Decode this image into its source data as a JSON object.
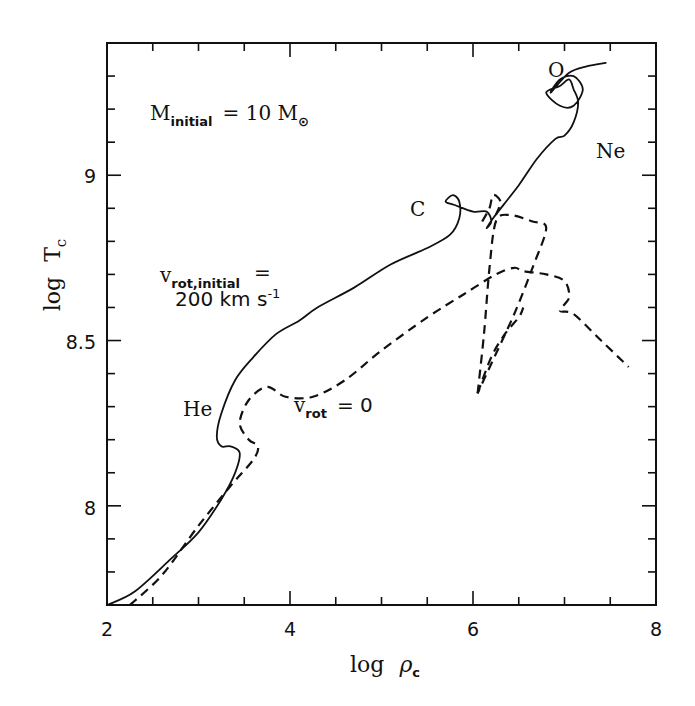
{
  "chart_data": {
    "type": "line",
    "title": "",
    "xlabel": "log ρc",
    "ylabel": "log Tc",
    "xlim": [
      2,
      8
    ],
    "ylim": [
      7.7,
      9.4
    ],
    "x_major_ticks": [
      2,
      4,
      6,
      8
    ],
    "x_tick_labels": [
      "2",
      "4",
      "6",
      "8"
    ],
    "x_minor_step": 0.5,
    "y_major_ticks": [
      8,
      8.5,
      9
    ],
    "y_tick_labels": [
      "8",
      "8.5",
      "9"
    ],
    "y_minor_step": 0.1,
    "grid": false,
    "legend": "none (inline annotations)",
    "series": [
      {
        "name": "v_rot,initial = 200 km s^-1",
        "style": "solid",
        "x": [
          2.0,
          2.3,
          2.7,
          3.0,
          3.25,
          3.4,
          3.45,
          3.35,
          3.25,
          3.2,
          3.25,
          3.4,
          3.6,
          3.85,
          4.1,
          4.3,
          4.7,
          5.1,
          5.5,
          5.75,
          5.85,
          5.85,
          5.78,
          5.7,
          5.8,
          6.0,
          6.15,
          6.2,
          6.15,
          6.22,
          6.5,
          6.7,
          6.9,
          7.0,
          7.1,
          7.15,
          7.1,
          7.05,
          6.95,
          6.8,
          6.95,
          7.1,
          7.2,
          7.1,
          6.95,
          6.85,
          7.05,
          7.25,
          7.45
        ],
        "y": [
          7.7,
          7.74,
          7.84,
          7.92,
          8.02,
          8.1,
          8.16,
          8.18,
          8.18,
          8.21,
          8.28,
          8.38,
          8.45,
          8.52,
          8.56,
          8.6,
          8.66,
          8.73,
          8.78,
          8.82,
          8.87,
          8.92,
          8.94,
          8.92,
          8.91,
          8.89,
          8.89,
          8.86,
          8.84,
          8.87,
          8.97,
          9.05,
          9.11,
          9.12,
          9.16,
          9.22,
          9.26,
          9.29,
          9.27,
          9.25,
          9.21,
          9.21,
          9.26,
          9.3,
          9.29,
          9.25,
          9.31,
          9.33,
          9.34
        ],
        "labels": [
          {
            "text": "He",
            "x": 3.08,
            "y": 8.27
          },
          {
            "text": "C",
            "x": 5.45,
            "y": 8.9
          },
          {
            "text": "Ne",
            "x": 7.3,
            "y": 9.06
          },
          {
            "text": "O",
            "x": 6.85,
            "y": 9.33
          }
        ]
      },
      {
        "name": "v_rot = 0",
        "style": "dashed",
        "x": [
          2.25,
          2.6,
          3.0,
          3.35,
          3.6,
          3.65,
          3.55,
          3.45,
          3.55,
          3.75,
          3.95,
          4.25,
          4.6,
          5.0,
          5.5,
          5.9,
          6.25,
          6.45,
          6.55,
          6.8,
          7.0,
          7.05,
          6.95,
          7.1,
          7.4,
          7.7
        ],
        "y": [
          7.7,
          7.79,
          7.94,
          8.06,
          8.14,
          8.18,
          8.2,
          8.25,
          8.32,
          8.36,
          8.33,
          8.33,
          8.38,
          8.47,
          8.57,
          8.64,
          8.7,
          8.72,
          8.71,
          8.7,
          8.68,
          8.63,
          8.59,
          8.58,
          8.5,
          8.42
        ],
        "branches": [
          {
            "x": [
              6.05,
              6.12,
              6.18,
              6.25,
              6.4,
              6.65,
              6.8,
              6.65,
              6.45,
              6.2,
              6.1,
              6.05
            ],
            "y": [
              8.34,
              8.52,
              8.72,
              8.86,
              8.88,
              8.86,
              8.84,
              8.72,
              8.58,
              8.43,
              8.37,
              8.34
            ]
          },
          {
            "x": [
              6.05,
              6.2,
              6.35,
              6.5,
              6.55
            ],
            "y": [
              8.34,
              8.45,
              8.52,
              8.57,
              8.6
            ]
          },
          {
            "x": [
              6.1,
              6.18,
              6.22,
              6.3,
              6.25
            ],
            "y": [
              8.86,
              8.9,
              8.94,
              8.92,
              8.88
            ]
          }
        ]
      }
    ],
    "annotations": [
      {
        "text": "M_initial = 10 M_sun",
        "x": 2.45,
        "y": 9.25
      },
      {
        "text": "v_rot,initial =",
        "x": 2.55,
        "y": 8.77
      },
      {
        "text": "200 km s^-1",
        "x": 2.6,
        "y": 8.67
      },
      {
        "text": "v_rot = 0",
        "x": 4.2,
        "y": 8.25
      }
    ]
  },
  "labels": {
    "x_ticks": [
      "2",
      "4",
      "6",
      "8"
    ],
    "y_ticks": [
      "8",
      "8.5",
      "9"
    ],
    "x_axis_log": "log",
    "x_axis_sym": "ρ",
    "x_axis_sub": "c",
    "y_axis_log": "log",
    "y_axis_sym": "T",
    "y_axis_sub": "c",
    "mass_main": "M",
    "mass_sub": "initial",
    "mass_rest": "=  10  M",
    "mass_sun": "⊙",
    "vrot_main": "v",
    "vrot_sub": "rot,initial",
    "vrot_eq": "=",
    "vrot_value": "200  km  s",
    "vrot_exp": "-1",
    "vzero_main": "v",
    "vzero_sub": "rot",
    "vzero_rest": "=  0",
    "he": "He",
    "c": "C",
    "ne": "Ne",
    "o": "O"
  }
}
